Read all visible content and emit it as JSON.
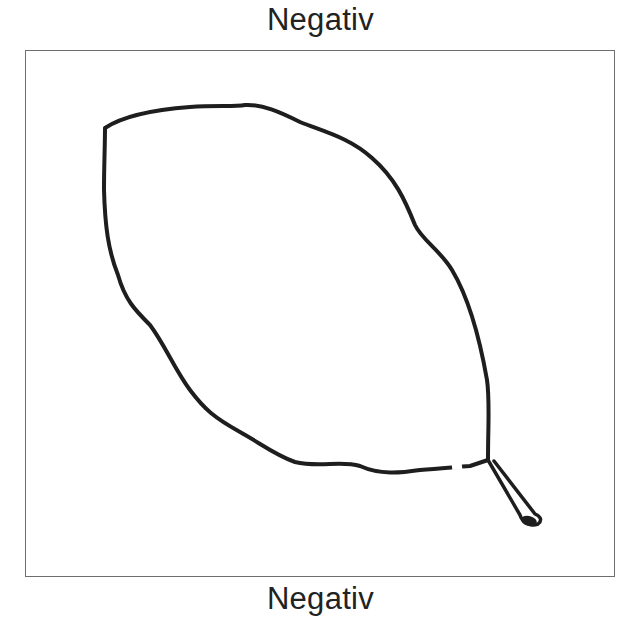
{
  "top_label": "Negativ",
  "bottom_label": "Negativ",
  "figure": {
    "stroke_color": "#1e1e1e",
    "frame_color": "#6e6e6e",
    "background_color": "#ffffff"
  }
}
